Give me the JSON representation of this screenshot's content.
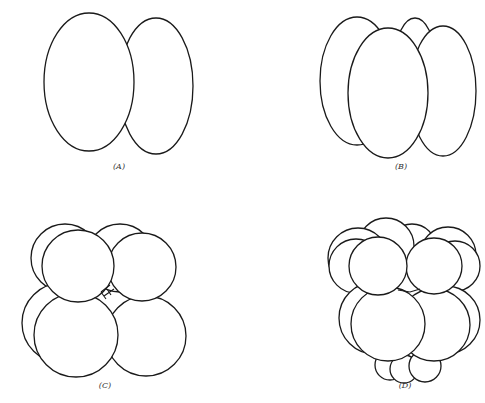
{
  "figures": [
    {
      "id": "A",
      "label": "(A)",
      "label_pos": {
        "x": 119,
        "y": 167
      },
      "shapes": [
        {
          "type": "ellipse",
          "cx": 156,
          "cy": 86,
          "rx": 37,
          "ry": 68
        },
        {
          "type": "ellipse",
          "cx": 89,
          "cy": 82,
          "rx": 45,
          "ry": 69
        }
      ]
    },
    {
      "id": "B",
      "label": "(B)",
      "label_pos": {
        "x": 401,
        "y": 167
      },
      "shapes": [
        {
          "type": "ellipse",
          "cx": 415,
          "cy": 60,
          "rx": 20,
          "ry": 42
        },
        {
          "type": "ellipse",
          "cx": 357,
          "cy": 81,
          "rx": 37,
          "ry": 64
        },
        {
          "type": "ellipse",
          "cx": 443,
          "cy": 91,
          "rx": 33,
          "ry": 65
        },
        {
          "type": "ellipse",
          "cx": 388,
          "cy": 93,
          "rx": 40,
          "ry": 65
        }
      ]
    },
    {
      "id": "C",
      "label": "(C)",
      "label_pos": {
        "x": 105,
        "y": 386
      },
      "shapes": [
        {
          "type": "circle",
          "cx": 120,
          "cy": 258,
          "r": 34
        },
        {
          "type": "circle",
          "cx": 65,
          "cy": 258,
          "r": 34
        },
        {
          "type": "circle",
          "cx": 62,
          "cy": 323,
          "r": 40
        },
        {
          "type": "circle",
          "cx": 146,
          "cy": 336,
          "r": 40
        },
        {
          "type": "circle",
          "cx": 76,
          "cy": 335,
          "r": 42
        },
        {
          "type": "circle",
          "cx": 142,
          "cy": 267,
          "r": 34
        },
        {
          "type": "circle",
          "cx": 78,
          "cy": 266,
          "r": 36
        }
      ]
    },
    {
      "id": "D",
      "label": "(D)",
      "label_pos": {
        "x": 405,
        "y": 386
      },
      "shapes": [
        {
          "type": "circle",
          "cx": 390,
          "cy": 365,
          "r": 15
        },
        {
          "type": "circle",
          "cx": 404,
          "cy": 369,
          "r": 14
        },
        {
          "type": "circle",
          "cx": 425,
          "cy": 366,
          "r": 16
        },
        {
          "type": "circle",
          "cx": 412,
          "cy": 248,
          "r": 24
        },
        {
          "type": "circle",
          "cx": 386,
          "cy": 246,
          "r": 28
        },
        {
          "type": "circle",
          "cx": 448,
          "cy": 255,
          "r": 28
        },
        {
          "type": "circle",
          "cx": 455,
          "cy": 266,
          "r": 25
        },
        {
          "type": "circle",
          "cx": 358,
          "cy": 258,
          "r": 30
        },
        {
          "type": "circle",
          "cx": 356,
          "cy": 266,
          "r": 27
        },
        {
          "type": "circle",
          "cx": 446,
          "cy": 320,
          "r": 34
        },
        {
          "type": "circle",
          "cx": 375,
          "cy": 318,
          "r": 36
        },
        {
          "type": "circle",
          "cx": 434,
          "cy": 325,
          "r": 36
        },
        {
          "type": "circle",
          "cx": 388,
          "cy": 324,
          "r": 37
        },
        {
          "type": "circle",
          "cx": 434,
          "cy": 266,
          "r": 28
        },
        {
          "type": "circle",
          "cx": 378,
          "cy": 266,
          "r": 29
        }
      ]
    }
  ]
}
